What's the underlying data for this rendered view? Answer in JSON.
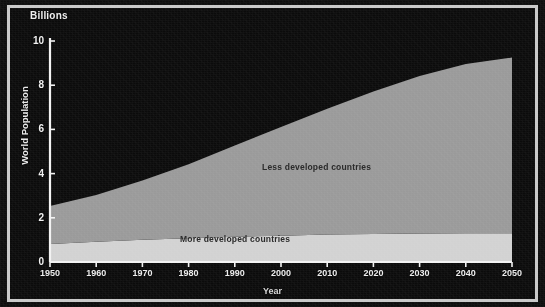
{
  "chart_data": {
    "type": "area",
    "stacked": true,
    "title": "",
    "subtitle": "",
    "xlabel": "Year",
    "ylabel": "World Population",
    "unit_label": "Billions",
    "xlim": [
      1950,
      2050
    ],
    "ylim": [
      0,
      10
    ],
    "grid": false,
    "legend_position": "in-plot-annotations",
    "background_color": "#0b0b0b",
    "frame_color": "#c9c9c9",
    "axis_color": "#f2f2f2",
    "x": [
      1950,
      1960,
      1970,
      1980,
      1990,
      2000,
      2010,
      2020,
      2030,
      2040,
      2050
    ],
    "xtick_labels": [
      "1950",
      "1960",
      "1970",
      "1980",
      "1990",
      "2000",
      "2010",
      "2020",
      "2030",
      "2040",
      "2050"
    ],
    "ytick_labels": [
      "0",
      "2",
      "4",
      "6",
      "8",
      "10"
    ],
    "yticks": [
      0,
      2,
      4,
      6,
      8,
      10
    ],
    "series": [
      {
        "name": "More developed countries",
        "color": "#d2d2d2",
        "label_color": "#2b2b2b",
        "values": [
          0.81,
          0.92,
          1.01,
          1.08,
          1.14,
          1.19,
          1.24,
          1.27,
          1.29,
          1.3,
          1.3
        ]
      },
      {
        "name": "Less developed countries",
        "color": "#9a9a9a",
        "label_color": "#2b2b2b",
        "values": [
          1.72,
          2.11,
          2.68,
          3.34,
          4.13,
          4.92,
          5.69,
          6.45,
          7.13,
          7.66,
          7.95
        ]
      }
    ],
    "totals": [
      2.53,
      3.03,
      3.69,
      4.42,
      5.27,
      6.11,
      6.93,
      7.72,
      8.42,
      8.96,
      9.25
    ]
  }
}
